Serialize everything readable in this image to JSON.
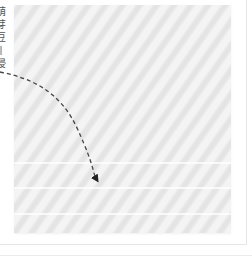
{
  "figure": {
    "image_placeholder": {
      "description": "light gray diagonally striped photo area",
      "base_color": "#ededed",
      "stripe_light": "#f4f4f4",
      "stripe_dark": "#e4e4e4",
      "horizontal_bands_y": [
        157,
        182,
        208
      ]
    },
    "caption": {
      "orientation": "vertical",
      "clipped": true,
      "chars": [
        "萌",
        "芽",
        "豆",
        "丨",
        "浸"
      ],
      "color": "#555555"
    },
    "pointer": {
      "style": "dashed-curved-arrow",
      "color": "#333333",
      "from": [
        0,
        72
      ],
      "to": [
        98,
        182
      ]
    }
  }
}
